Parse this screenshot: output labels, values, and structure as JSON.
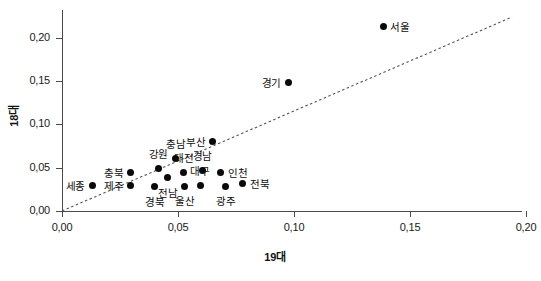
{
  "chart_data": {
    "type": "scatter",
    "title": "",
    "xlabel": "19대",
    "ylabel": "18대",
    "xlim": [
      -0.005,
      0.2185
    ],
    "ylim": [
      0.0,
      0.2235
    ],
    "grid": false,
    "legend": null,
    "decimal_separator": ",",
    "xticks": [
      "0,00",
      "0,05",
      "0,10",
      "0,15",
      "0,20"
    ],
    "xtick_values": [
      0.0,
      0.05,
      0.1,
      0.15,
      0.2
    ],
    "yticks": [
      "0,00",
      "0,05",
      "0,10",
      "0,15",
      "0,20"
    ],
    "ytick_values": [
      0.0,
      0.05,
      0.1,
      0.15,
      0.2
    ],
    "reference_line": {
      "style": "dashed",
      "description": "45-degree diagonal reference line",
      "x": [
        0.0,
        0.194
      ],
      "y": [
        0.0,
        0.224
      ]
    },
    "points": [
      {
        "label": "서울",
        "x": 0.1385,
        "y": 0.2135,
        "label_pos": "right"
      },
      {
        "label": "경기",
        "x": 0.0975,
        "y": 0.1485,
        "label_pos": "left"
      },
      {
        "label": "부산",
        "x": 0.065,
        "y": 0.0805,
        "label_pos": "left"
      },
      {
        "label": "충남",
        "x": 0.049,
        "y": 0.061,
        "label_pos": "above"
      },
      {
        "label": "강원",
        "x": 0.0415,
        "y": 0.0495,
        "label_pos": "above"
      },
      {
        "label": "대전",
        "x": 0.0525,
        "y": 0.045,
        "label_pos": "above"
      },
      {
        "label": "경남",
        "x": 0.0605,
        "y": 0.0473,
        "label_pos": "above"
      },
      {
        "label": "인천",
        "x": 0.0685,
        "y": 0.045,
        "label_pos": "right"
      },
      {
        "label": "충북",
        "x": 0.0295,
        "y": 0.045,
        "label_pos": "left"
      },
      {
        "label": "전남",
        "x": 0.0455,
        "y": 0.0385,
        "label_pos": "below"
      },
      {
        "label": "대구",
        "x": 0.0595,
        "y": 0.03,
        "label_pos": "above"
      },
      {
        "label": "제주",
        "x": 0.0295,
        "y": 0.03,
        "label_pos": "left"
      },
      {
        "label": "세종",
        "x": 0.013,
        "y": 0.03,
        "label_pos": "left"
      },
      {
        "label": "경북",
        "x": 0.04,
        "y": 0.028,
        "label_pos": "below"
      },
      {
        "label": "울산",
        "x": 0.053,
        "y": 0.0285,
        "label_pos": "below"
      },
      {
        "label": "광주",
        "x": 0.0705,
        "y": 0.0285,
        "label_pos": "below"
      },
      {
        "label": "전북",
        "x": 0.078,
        "y": 0.0318,
        "label_pos": "right"
      }
    ]
  }
}
